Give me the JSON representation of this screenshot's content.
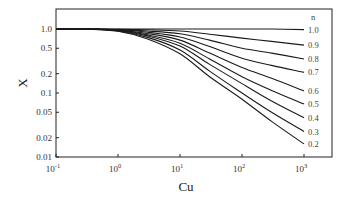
{
  "chart_data": {
    "type": "line",
    "title": "",
    "xlabel": "Cu",
    "ylabel": "X",
    "xscale": "log",
    "yscale": "log",
    "xlim": [
      0.1,
      1000
    ],
    "ylim": [
      0.01,
      1.6
    ],
    "x_ticks": [
      0.1,
      1,
      10,
      100,
      1000
    ],
    "x_tick_labels": [
      {
        "base": "10",
        "exp": "-1"
      },
      {
        "base": "10",
        "exp": "0"
      },
      {
        "base": "10",
        "exp": "1"
      },
      {
        "base": "10",
        "exp": "2"
      },
      {
        "base": "10",
        "exp": "3"
      }
    ],
    "y_ticks": [
      1.0,
      0.5,
      0.2,
      0.1,
      0.05,
      0.02,
      0.01
    ],
    "y_tick_labels": [
      "1.0",
      "0.5",
      "0.2",
      "0.1",
      "0.05",
      "0.02",
      "0.01"
    ],
    "grid": false,
    "legend_title": "n",
    "legend_position": "right, labels at line ends",
    "x": [
      0.1,
      0.3,
      1,
      3,
      10,
      30,
      100,
      300,
      1000
    ],
    "series": [
      {
        "name": "1.0",
        "values": [
          1.0,
          1.0,
          1.0,
          1.0,
          1.0,
          1.0,
          1.0,
          1.0,
          0.98
        ]
      },
      {
        "name": "0.9",
        "values": [
          1.0,
          1.0,
          0.99,
          0.97,
          0.93,
          0.83,
          0.72,
          0.64,
          0.56
        ]
      },
      {
        "name": "0.8",
        "values": [
          1.0,
          1.0,
          0.98,
          0.93,
          0.84,
          0.67,
          0.5,
          0.42,
          0.34
        ]
      },
      {
        "name": "0.7",
        "values": [
          1.0,
          1.0,
          0.97,
          0.89,
          0.75,
          0.53,
          0.35,
          0.27,
          0.21
        ]
      },
      {
        "name": "0.6",
        "values": [
          1.0,
          1.0,
          0.96,
          0.85,
          0.67,
          0.42,
          0.25,
          0.17,
          0.108
        ]
      },
      {
        "name": "0.5",
        "values": [
          1.0,
          1.0,
          0.95,
          0.81,
          0.6,
          0.34,
          0.18,
          0.11,
          0.067
        ]
      },
      {
        "name": "0.4",
        "values": [
          1.0,
          1.0,
          0.94,
          0.78,
          0.54,
          0.28,
          0.14,
          0.075,
          0.041
        ]
      },
      {
        "name": "0.3",
        "values": [
          1.0,
          1.0,
          0.93,
          0.74,
          0.47,
          0.22,
          0.1,
          0.05,
          0.025
        ]
      },
      {
        "name": "0.2",
        "values": [
          1.0,
          1.0,
          0.92,
          0.7,
          0.41,
          0.18,
          0.08,
          0.036,
          0.016
        ]
      }
    ]
  }
}
